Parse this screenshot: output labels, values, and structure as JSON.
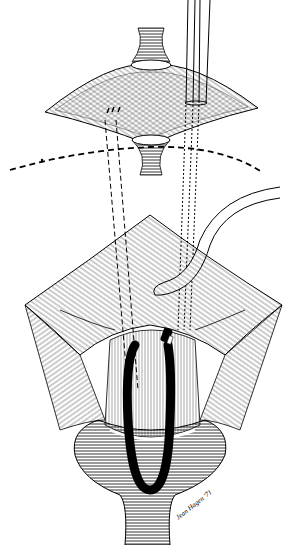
{
  "figure": {
    "kind": "surgical line illustration",
    "style": "black ink pen-and-hatch drawing on white",
    "colors": {
      "ink": "#000000",
      "paper": "#ffffff"
    },
    "signature": "Jean Hagen '71"
  }
}
